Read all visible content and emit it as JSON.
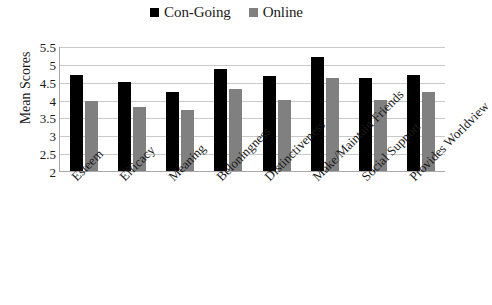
{
  "chart_data": {
    "type": "bar",
    "title": "",
    "xlabel": "",
    "ylabel": "Mean Scores",
    "ylim": [
      2,
      5.5
    ],
    "yticks": [
      "2",
      "2.5",
      "3",
      "3.5",
      "4",
      "4.5",
      "5",
      "5.5"
    ],
    "grid": true,
    "legend_position": "top-center",
    "categories": [
      "Esteem",
      "Efficacy",
      "Meaning",
      "Beloningness",
      "Distinctiveness",
      "Make/Maintain Friends",
      "Social Support",
      "Provides Worldview"
    ],
    "series": [
      {
        "name": "Con-Going",
        "color": "#000000",
        "values": [
          4.7,
          4.5,
          4.2,
          4.85,
          4.65,
          5.2,
          4.6,
          4.7
        ]
      },
      {
        "name": "Online",
        "color": "#808080",
        "values": [
          3.95,
          3.8,
          3.7,
          4.3,
          4.0,
          4.6,
          4.0,
          4.2
        ]
      }
    ]
  },
  "legend": {
    "items": [
      {
        "label": "Con-Going",
        "swatch": "legend-swatch-black"
      },
      {
        "label": "Online",
        "swatch": "legend-swatch-gray"
      }
    ]
  }
}
